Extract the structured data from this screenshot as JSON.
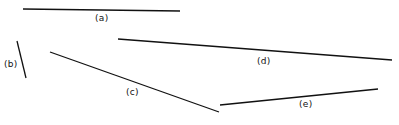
{
  "figure": {
    "background_color": "#ffffff",
    "line_color": "#111111",
    "text_color": "#111111",
    "width": 399,
    "height": 125
  },
  "chart_data": {
    "type": "scatter",
    "title": "",
    "subtitle": "",
    "xlabel": "",
    "ylabel": "",
    "xlim": [
      0,
      399
    ],
    "ylim": [
      125,
      0
    ],
    "grid": false,
    "legend": "none",
    "series": [
      {
        "name": "(a)",
        "label": "(a)",
        "x1": 23,
        "y1": 9,
        "x2": 180,
        "y2": 11,
        "label_x": 95,
        "label_y": 14
      },
      {
        "name": "(b)",
        "label": "(b)",
        "x1": 17,
        "y1": 41,
        "x2": 26,
        "y2": 78,
        "label_x": 4,
        "label_y": 60
      },
      {
        "name": "(c)",
        "label": "(c)",
        "x1": 50,
        "y1": 52,
        "x2": 219,
        "y2": 112,
        "label_x": 126,
        "label_y": 88
      },
      {
        "name": "(d)",
        "label": "(d)",
        "x1": 118,
        "y1": 39,
        "x2": 392,
        "y2": 60,
        "label_x": 257,
        "label_y": 57
      },
      {
        "name": "(e)",
        "label": "(e)",
        "x1": 220,
        "y1": 105,
        "x2": 378,
        "y2": 89,
        "label_x": 299,
        "label_y": 100
      }
    ]
  }
}
